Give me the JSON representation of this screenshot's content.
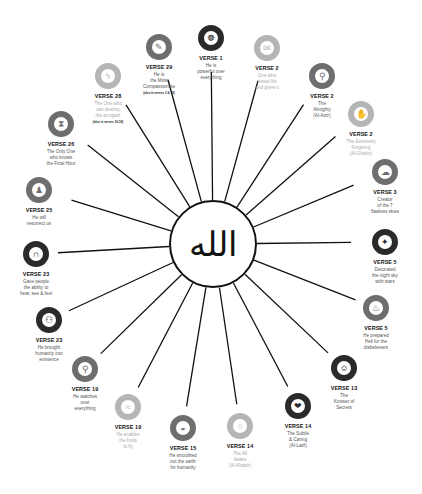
{
  "center": {
    "label": "الله",
    "name": "Allah"
  },
  "colors": {
    "dark": "#2a2a2a",
    "medium": "#6e6e6e",
    "light": "#b5b5b5",
    "line": "#111111"
  },
  "nodes": [
    {
      "verse": "VERSE 1",
      "desc": [
        "He is",
        "powerful over",
        "everything"
      ],
      "note": "",
      "icon": "mind-icon",
      "glyph": "☸",
      "tone": "dark",
      "x": 211,
      "y": 38
    },
    {
      "verse": "VERSE 2",
      "desc": [
        "One who",
        "tested life",
        "and gives it"
      ],
      "note": "",
      "icon": "envelope-icon",
      "glyph": "✉",
      "tone": "light",
      "x": 267,
      "y": 48
    },
    {
      "verse": "VERSE 2",
      "desc": [
        "The",
        "Almighty",
        "(Al-Aziz)"
      ],
      "note": "",
      "icon": "magnifier-icon",
      "glyph": "⚲",
      "tone": "medium",
      "x": 322,
      "y": 76
    },
    {
      "verse": "VERSE 2",
      "desc": [
        "The Extremely",
        "Forgiving",
        "(Al-Ghafur)"
      ],
      "note": "",
      "icon": "hand-icon",
      "glyph": "✋",
      "tone": "light",
      "x": 361,
      "y": 114
    },
    {
      "verse": "VERSE 3",
      "desc": [
        "Creator",
        "of the 7",
        "flawless skies"
      ],
      "note": "",
      "icon": "clouds-icon",
      "glyph": "☁",
      "tone": "medium",
      "x": 385,
      "y": 172
    },
    {
      "verse": "VERSE 5",
      "desc": [
        "Decorated",
        "the night sky",
        "with stars"
      ],
      "note": "",
      "icon": "stars-icon",
      "glyph": "✦",
      "tone": "dark",
      "x": 385,
      "y": 242
    },
    {
      "verse": "VERSE 5",
      "desc": [
        "He prepared",
        "Hell for the",
        "disbelievers"
      ],
      "note": "",
      "icon": "fire-icon",
      "glyph": "♨",
      "tone": "medium",
      "x": 376,
      "y": 308
    },
    {
      "verse": "VERSE 13",
      "desc": [
        "The",
        "Knower of",
        "Secrets"
      ],
      "note": "",
      "icon": "head-icon",
      "glyph": "☺",
      "tone": "dark",
      "x": 344,
      "y": 368
    },
    {
      "verse": "VERSE 14",
      "desc": [
        "The Subtle",
        "& Caring",
        "(Al-Latif)"
      ],
      "note": "",
      "icon": "heart-hand-icon",
      "glyph": "❤",
      "tone": "dark",
      "x": 298,
      "y": 406
    },
    {
      "verse": "VERSE 14",
      "desc": [
        "The All",
        "Aware",
        "(Al-Khabir)"
      ],
      "note": "",
      "icon": "lightbulb-icon",
      "glyph": "☼",
      "tone": "light",
      "x": 240,
      "y": 426
    },
    {
      "verse": "VERSE 15",
      "desc": [
        "He smoothed",
        "out the earth",
        "for humanity"
      ],
      "note": "",
      "icon": "earth-icon",
      "glyph": "◒",
      "tone": "medium",
      "x": 183,
      "y": 428
    },
    {
      "verse": "VERSE 19",
      "desc": [
        "He enables",
        "the birds",
        "to fly"
      ],
      "note": "",
      "icon": "bird-icon",
      "glyph": "≈",
      "tone": "light",
      "x": 128,
      "y": 407
    },
    {
      "verse": "VERSE 19",
      "desc": [
        "He watches",
        "over",
        "everything"
      ],
      "note": "",
      "icon": "magnifier-icon",
      "glyph": "⚲",
      "tone": "medium",
      "x": 85,
      "y": 369
    },
    {
      "verse": "VERSE 23",
      "desc": [
        "He brought",
        "humanity into",
        "existence"
      ],
      "note": "",
      "icon": "people-icon",
      "glyph": "⚇",
      "tone": "dark",
      "x": 49,
      "y": 320
    },
    {
      "verse": "VERSE 23",
      "desc": [
        "Gave people",
        "the ability to",
        "hear, see & feel"
      ],
      "note": "",
      "icon": "senses-icon",
      "glyph": "∩",
      "tone": "dark",
      "x": 36,
      "y": 254
    },
    {
      "verse": "VERSE 25",
      "desc": [
        "He will",
        "resurrect us"
      ],
      "note": "",
      "icon": "resurrection-icon",
      "glyph": "♟",
      "tone": "medium",
      "x": 39,
      "y": 190
    },
    {
      "verse": "VERSE 26",
      "desc": [
        "The Only One",
        "who knows",
        "the Final Hour"
      ],
      "note": "",
      "icon": "hourglass-icon",
      "glyph": "⧗",
      "tone": "medium",
      "x": 61,
      "y": 124
    },
    {
      "verse": "VERSE 28",
      "desc": [
        "The One who",
        "can destroy",
        "the arrogant"
      ],
      "note": "(also in verses 16-18)",
      "icon": "lightning-icon",
      "glyph": "ϟ",
      "tone": "light",
      "x": 108,
      "y": 76
    },
    {
      "verse": "VERSE 29",
      "desc": [
        "He is",
        "the Most",
        "Compassionate"
      ],
      "note": "(also in verses 3 & 19)",
      "icon": "handshake-icon",
      "glyph": "✎",
      "tone": "medium",
      "x": 159,
      "y": 47
    }
  ]
}
